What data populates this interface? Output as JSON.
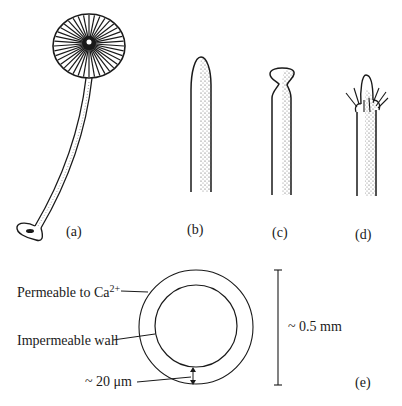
{
  "figure": {
    "panels": [
      {
        "id": "a",
        "label": "(a)",
        "description": "Whole organism: radiating cap on long curved stalk with rhizoid foot"
      },
      {
        "id": "b",
        "label": "(b)",
        "description": "Stalk with rounded tapering tip"
      },
      {
        "id": "c",
        "label": "(c)",
        "description": "Stalk with cup-shaped apical expansion"
      },
      {
        "id": "d",
        "label": "(d)",
        "description": "Stalk tip with whorl of hairs"
      },
      {
        "id": "e",
        "label": "(e)",
        "description": "Cross-section of stalk showing two concentric layers"
      }
    ],
    "cross_section": {
      "outer_label": "Permeable to Ca",
      "outer_label_sup": "2+",
      "inner_label": "Impermeable wall",
      "thickness_label": "~ 20 μm",
      "diameter_label": "~ 0.5 mm"
    }
  },
  "colors": {
    "ink": "#1a1a1a",
    "background": "#ffffff"
  }
}
